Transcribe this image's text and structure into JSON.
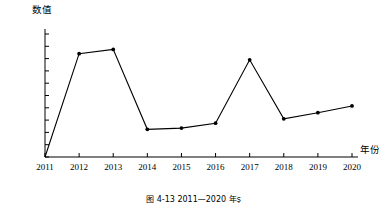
{
  "chart_data": {
    "type": "line",
    "title": "",
    "xlabel": "年份",
    "ylabel": "数值",
    "categories": [
      "2011",
      "2012",
      "2013",
      "2014",
      "2015",
      "2016",
      "2017",
      "2018",
      "2019",
      "2020"
    ],
    "values": [
      0.25,
      0.418,
      0.425,
      0.295,
      0.297,
      0.305,
      0.408,
      0.312,
      0.322,
      0.333
    ],
    "x": [
      2011,
      2012,
      2013,
      2014,
      2015,
      2016,
      2017,
      2018,
      2019,
      2020
    ],
    "xlim": [
      2011,
      2020
    ],
    "ylim": [
      0.25,
      0.45
    ],
    "y_ticks": [
      "0.25",
      "0.27",
      "0.29",
      "0.31",
      "0.33",
      "0.35",
      "0.37",
      "0.39",
      "0.41",
      "0.43",
      "0.45"
    ],
    "y_tick_values": [
      0.25,
      0.27,
      0.29,
      0.31,
      0.33,
      0.35,
      0.37,
      0.39,
      0.41,
      0.43,
      0.45
    ],
    "x_ticks": [
      "2011",
      "2012",
      "2013",
      "2014",
      "2015",
      "2016",
      "2017",
      "2018",
      "2019",
      "2020"
    ],
    "grid": false,
    "legend": false,
    "legend_position": "none",
    "series": [
      {
        "name": "数值",
        "values": [
          0.25,
          0.418,
          0.425,
          0.295,
          0.297,
          0.305,
          0.408,
          0.312,
          0.322,
          0.333
        ],
        "color": "#000000",
        "marker": "circle"
      }
    ],
    "annotations": []
  },
  "axes": {
    "y_title": "数值",
    "x_title": "年份"
  },
  "caption": {
    "text": "图 4-13   2011—2020 年ṣ"
  },
  "colors": {
    "line": "#1a1a1a",
    "axis": "#000000",
    "marker": "#000000",
    "background": "#ffffff"
  }
}
